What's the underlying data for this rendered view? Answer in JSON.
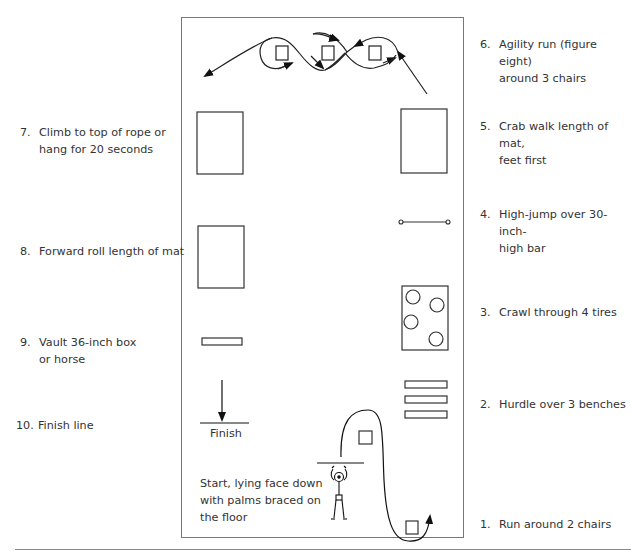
{
  "stations": [
    {
      "number": "1.",
      "text": "Run around 2 chairs",
      "side": "right"
    },
    {
      "number": "2.",
      "text": "Hurdle over 3 benches",
      "side": "right"
    },
    {
      "number": "3.",
      "text": "Crawl through 4 tires",
      "side": "right"
    },
    {
      "number": "4.",
      "text_line1": "High-jump over 30-inch-",
      "text_line2": "high bar",
      "side": "right"
    },
    {
      "number": "5.",
      "text_line1": "Crab walk length of mat,",
      "text_line2": "feet first",
      "side": "right"
    },
    {
      "number": "6.",
      "text_line1": "Agility run (figure eight)",
      "text_line2": "around 3 chairs",
      "side": "right"
    },
    {
      "number": "7.",
      "text_line1": "Climb to top of rope or",
      "text_line2": "hang for 20 seconds",
      "side": "left"
    },
    {
      "number": "8.",
      "text": "Forward roll length of mat",
      "side": "left"
    },
    {
      "number": "9.",
      "text_line1": "Vault 36-inch box",
      "text_line2": "or horse",
      "side": "left"
    },
    {
      "number": "10.",
      "text": "Finish line",
      "side": "left"
    }
  ],
  "diagram": {
    "finish_label": "Finish",
    "start_line1": "Start, lying face down",
    "start_line2": "with palms braced on",
    "start_line3": "the floor"
  }
}
